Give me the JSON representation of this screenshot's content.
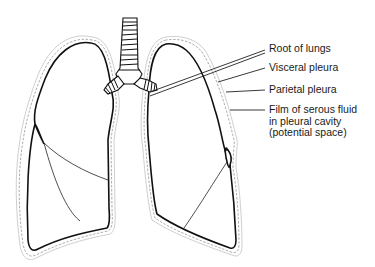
{
  "diagram": {
    "type": "anatomical-illustration",
    "labels": [
      {
        "id": "root",
        "text": "Root of lungs"
      },
      {
        "id": "visceral",
        "text": "Visceral pleura"
      },
      {
        "id": "parietal",
        "text": "Parietal pleura"
      },
      {
        "id": "film",
        "text": "Film of serous fluid\nin pleural cavity\n(potential space)"
      }
    ],
    "parts": [
      "trachea",
      "bronchi",
      "right-lung",
      "left-lung",
      "horizontal-fissure",
      "oblique-fissure",
      "visceral-pleura",
      "parietal-pleura"
    ],
    "colors": {
      "line": "#111111",
      "pleura": "#cfcfcf",
      "background": "#ffffff"
    }
  }
}
